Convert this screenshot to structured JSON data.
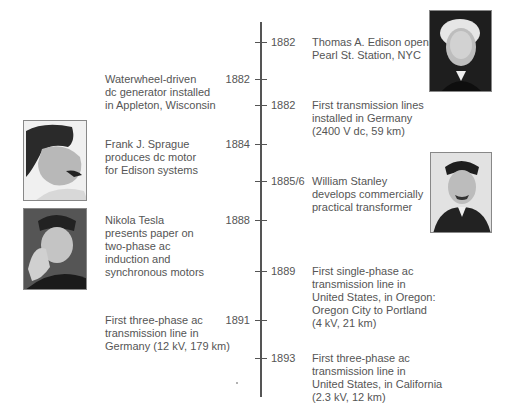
{
  "timeline": {
    "events": [
      {
        "year": "1882",
        "side": "right",
        "text": "Thomas A. Edison opens\nPearl St. Station, NYC",
        "person": "Thomas A. Edison"
      },
      {
        "year": "1882",
        "side": "left",
        "text": "Waterwheel-driven\ndc generator installed\nin Appleton, Wisconsin"
      },
      {
        "year": "1882",
        "side": "right",
        "text": "First transmission lines\ninstalled in Germany\n(2400 V dc, 59 km)"
      },
      {
        "year": "1884",
        "side": "left",
        "text": "Frank J. Sprague\nproduces dc motor\nfor Edison systems",
        "person": "Frank J. Sprague"
      },
      {
        "year": "1885/6",
        "side": "right",
        "text": "William Stanley\ndevelops commercially\npractical transformer",
        "person": "William Stanley"
      },
      {
        "year": "1888",
        "side": "left",
        "text": "Nikola Tesla\npresents paper on\ntwo-phase ac\ninduction and\nsynchronous motors",
        "person": "Nikola Tesla"
      },
      {
        "year": "1889",
        "side": "right",
        "text": "First single-phase ac\ntransmission line in\nUnited States, in Oregon:\nOregon City to Portland\n(4 kV, 21 km)"
      },
      {
        "year": "1891",
        "side": "left",
        "text": "First three-phase ac\ntransmission line in\nGermany (12 kV, 179 km)"
      },
      {
        "year": "1893",
        "side": "right",
        "text": "First three-phase ac\ntransmission line in\nUnited States, in California\n(2.3 kV, 12 km)"
      }
    ]
  },
  "photos": {
    "edison": "portrait-thomas-edison",
    "sprague": "portrait-frank-sprague",
    "tesla": "portrait-nikola-tesla",
    "stanley": "portrait-william-stanley"
  }
}
